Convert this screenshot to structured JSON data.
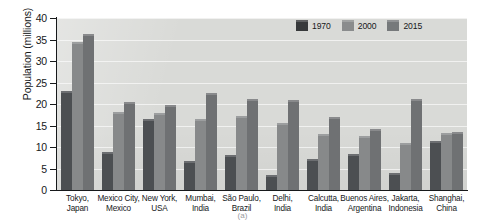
{
  "chart_data": {
    "type": "bar",
    "title": "",
    "subtitle": "",
    "xlabel": "",
    "ylabel": "Population (millions)",
    "ylim": [
      0,
      40
    ],
    "ytick_step": 5,
    "yticks": [
      "40",
      "35",
      "30",
      "25",
      "20",
      "15",
      "10",
      "5",
      "0"
    ],
    "grid": true,
    "grid_axis": "y",
    "legend_position": "top-right",
    "categories": [
      "Tokyo,\nJapan",
      "Mexico City,\nMexico",
      "New York,\nUSA",
      "Mumbai,\nIndia",
      "São Paulo,\nBrazil",
      "Delhi,\nIndia",
      "Calcutta,\nIndia",
      "Buenos Aires,\nArgentina",
      "Jakarta,\nIndonesia",
      "Shanghai,\nChina"
    ],
    "category_lines": [
      [
        "Tokyo,",
        "Japan"
      ],
      [
        "Mexico City,",
        "Mexico"
      ],
      [
        "New York,",
        "USA"
      ],
      [
        "Mumbai,",
        "India"
      ],
      [
        "São Paulo,",
        "Brazil"
      ],
      [
        "Delhi,",
        "India"
      ],
      [
        "Calcutta,",
        "India"
      ],
      [
        "Buenos Aires,",
        "Argentina"
      ],
      [
        "Jakarta,",
        "Indonesia"
      ],
      [
        "Shanghai,",
        "China"
      ]
    ],
    "series": [
      {
        "name": "1970",
        "color": "#4c4f52",
        "values": [
          23.0,
          8.8,
          16.5,
          6.7,
          8.1,
          3.6,
          7.3,
          8.4,
          3.9,
          11.4
        ]
      },
      {
        "name": "2000",
        "color": "#87898a",
        "values": [
          34.5,
          18.1,
          17.9,
          16.5,
          17.2,
          15.7,
          13.1,
          12.6,
          11.0,
          13.2
        ]
      },
      {
        "name": "2015",
        "color": "#6f7173",
        "values": [
          36.2,
          20.4,
          19.7,
          22.6,
          21.2,
          20.9,
          17.0,
          14.1,
          21.2,
          13.6
        ]
      }
    ]
  },
  "legend": {
    "items": [
      {
        "label": "1970"
      },
      {
        "label": "2000"
      },
      {
        "label": "2015"
      }
    ]
  },
  "caption": {
    "text": "(a)"
  }
}
